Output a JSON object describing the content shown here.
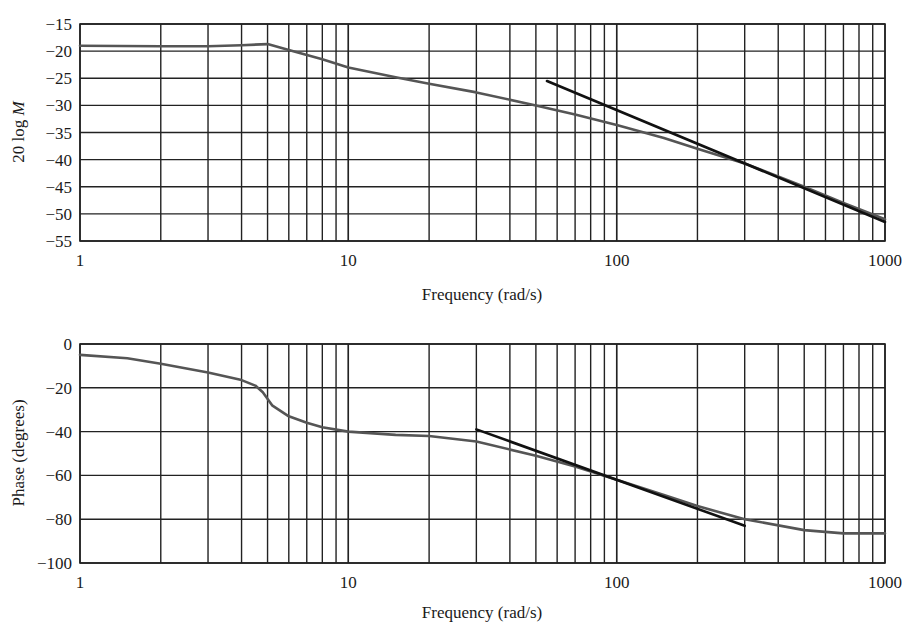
{
  "chart_data": [
    {
      "type": "line",
      "title": "",
      "xlabel": "Frequency (rad/s)",
      "ylabel": "20 log M",
      "xscale": "log",
      "xlim": [
        1,
        1000
      ],
      "ylim": [
        -55,
        -15
      ],
      "xticks": [
        "1",
        "10",
        "100",
        "1000"
      ],
      "yticks": [
        "-15",
        "-20",
        "-25",
        "-30",
        "-35",
        "-40",
        "-45",
        "-50",
        "-55"
      ],
      "grid": true,
      "legend": null,
      "series": [
        {
          "name": "magnitude",
          "color": "#555555",
          "x": [
            1,
            2,
            3,
            4,
            5,
            6,
            8,
            10,
            15,
            20,
            30,
            50,
            70,
            100,
            150,
            200,
            300,
            500,
            700,
            1000
          ],
          "y": [
            -19,
            -19.1,
            -19.1,
            -18.9,
            -18.7,
            -19.8,
            -21.5,
            -23,
            -24.8,
            -26,
            -27.6,
            -30,
            -31.7,
            -33.6,
            -36,
            -38,
            -40.7,
            -45,
            -48,
            -51
          ]
        },
        {
          "name": "asymptote",
          "color": "#111111",
          "x": [
            55,
            1000
          ],
          "y": [
            -25.5,
            -51.5
          ]
        }
      ]
    },
    {
      "type": "line",
      "title": "",
      "xlabel": "Frequency (rad/s)",
      "ylabel": "Phase (degrees)",
      "xscale": "log",
      "xlim": [
        1,
        1000
      ],
      "ylim": [
        -100,
        0
      ],
      "xticks": [
        "1",
        "10",
        "100",
        "1000"
      ],
      "yticks": [
        "0",
        "-20",
        "-40",
        "-60",
        "-80",
        "-100"
      ],
      "grid": true,
      "legend": null,
      "series": [
        {
          "name": "phase",
          "color": "#555555",
          "x": [
            1,
            1.5,
            2,
            3,
            4,
            4.5,
            4.8,
            5.2,
            6,
            7,
            8,
            10,
            15,
            20,
            30,
            50,
            70,
            100,
            150,
            200,
            300,
            500,
            700,
            1000
          ],
          "y": [
            -5,
            -6.5,
            -9,
            -13,
            -16.5,
            -19,
            -22,
            -28,
            -33,
            -36,
            -38,
            -40,
            -41.5,
            -42,
            -44.5,
            -51,
            -56,
            -62,
            -69,
            -74,
            -80,
            -85,
            -86.5,
            -86.5
          ]
        },
        {
          "name": "asymptote",
          "color": "#111111",
          "x": [
            30,
            300
          ],
          "y": [
            -39,
            -83
          ]
        }
      ]
    }
  ],
  "figure": {
    "top": {
      "ylabel_prefix": "20 log ",
      "ylabel_var": "M",
      "xlabel": "Frequency (rad/s)"
    },
    "bottom": {
      "ylabel": "Phase (degrees)",
      "xlabel": "Frequency (rad/s)"
    }
  }
}
